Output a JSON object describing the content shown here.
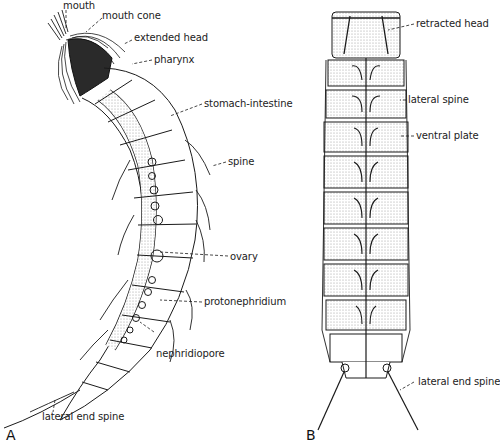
{
  "figure": {
    "panel_a": {
      "letter": "A",
      "labels": {
        "mouth": "mouth",
        "mouth_cone": "mouth cone",
        "extended_head": "extended head",
        "pharynx": "pharynx",
        "stomach_intestine": "stomach-intestine",
        "spine": "spine",
        "ovary": "ovary",
        "protonephridium": "protonephridium",
        "nephridiopore": "nephridiopore",
        "lateral_end_spine": "lateral end spine"
      }
    },
    "panel_b": {
      "letter": "B",
      "labels": {
        "retracted_head": "retracted head",
        "lateral_spine": "lateral spine",
        "ventral_plate": "ventral plate",
        "lateral_end_spine": "lateral end spine"
      }
    }
  },
  "colors": {
    "ink": "#1a1a1a",
    "stipple": "#d8d8d8",
    "background": "#ffffff"
  }
}
